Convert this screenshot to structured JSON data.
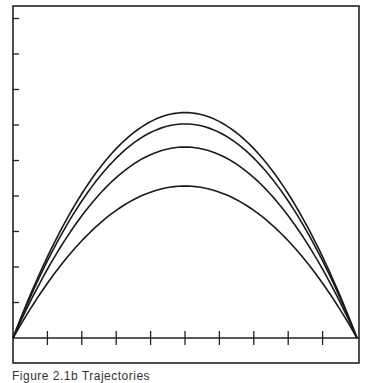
{
  "chart_data": {
    "type": "line",
    "title": "",
    "xlabel": "",
    "ylabel": "",
    "xlim": [
      0,
      10
    ],
    "ylim": [
      0,
      9.0
    ],
    "x_ticks": [
      1,
      2,
      3,
      4,
      5,
      6,
      7,
      8,
      9
    ],
    "y_ticks": [
      1,
      2,
      3,
      4,
      5,
      6,
      7,
      8,
      9
    ],
    "tick_labels_shown": false,
    "grid": false,
    "legend": null,
    "x": [
      0,
      1,
      2,
      3,
      4,
      5,
      6,
      7,
      8,
      9,
      10
    ],
    "series": [
      {
        "name": "curve-1",
        "peak": 6.35,
        "values": [
          0,
          2.29,
          4.06,
          5.33,
          6.1,
          6.35,
          6.1,
          5.33,
          4.06,
          2.29,
          0
        ]
      },
      {
        "name": "curve-2",
        "peak": 6.03,
        "values": [
          0,
          2.17,
          3.86,
          5.07,
          5.79,
          6.03,
          5.79,
          5.07,
          3.86,
          2.17,
          0
        ]
      },
      {
        "name": "curve-3",
        "peak": 5.38,
        "values": [
          0,
          1.94,
          3.44,
          4.52,
          5.16,
          5.38,
          5.16,
          4.52,
          3.44,
          1.94,
          0
        ]
      },
      {
        "name": "curve-4",
        "peak": 4.28,
        "values": [
          0,
          1.54,
          2.74,
          3.6,
          4.11,
          4.28,
          4.11,
          3.6,
          2.74,
          1.54,
          0
        ]
      }
    ]
  },
  "caption": "Figure 2.1b  Trajectories",
  "colors": {
    "line": "#1a1a1a",
    "frame": "#222222",
    "background": "#ffffff"
  }
}
